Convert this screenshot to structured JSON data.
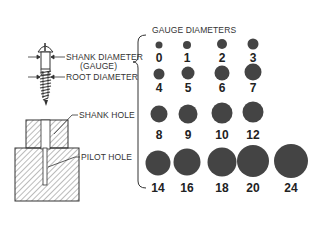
{
  "labels": {
    "shank_diameter": "SHANK DIAMETER",
    "gauge": "(GAUGE)",
    "root_diameter": "ROOT DIAMETER",
    "shank_hole": "SHANK HOLE",
    "pilot_hole": "PILOT HOLE",
    "gauge_diameters_title": "GAUGE DIAMETERS"
  },
  "colors": {
    "dot": "#444444",
    "line": "#333333"
  },
  "gauges": [
    {
      "label": "0",
      "x": 159,
      "y": 45,
      "d": 7
    },
    {
      "label": "1",
      "x": 187,
      "y": 45,
      "d": 8
    },
    {
      "label": "2",
      "x": 222,
      "y": 44,
      "d": 10
    },
    {
      "label": "3",
      "x": 253,
      "y": 44,
      "d": 11
    },
    {
      "label": "4",
      "x": 159,
      "y": 74,
      "d": 11
    },
    {
      "label": "5",
      "x": 188,
      "y": 73,
      "d": 13
    },
    {
      "label": "6",
      "x": 222,
      "y": 73,
      "d": 15
    },
    {
      "label": "7",
      "x": 253,
      "y": 72,
      "d": 17
    },
    {
      "label": "8",
      "x": 159,
      "y": 114,
      "d": 17
    },
    {
      "label": "9",
      "x": 188,
      "y": 114,
      "d": 19
    },
    {
      "label": "10",
      "x": 222,
      "y": 113,
      "d": 21
    },
    {
      "label": "12",
      "x": 253,
      "y": 112,
      "d": 21
    },
    {
      "label": "14",
      "x": 158,
      "y": 163,
      "d": 25
    },
    {
      "label": "16",
      "x": 187,
      "y": 162,
      "d": 27
    },
    {
      "label": "18",
      "x": 222,
      "y": 162,
      "d": 29
    },
    {
      "label": "20",
      "x": 253,
      "y": 161,
      "d": 32
    },
    {
      "label": "24",
      "x": 291,
      "y": 161,
      "d": 34
    }
  ],
  "gauge_label_rows": [
    58,
    88,
    135,
    188
  ]
}
